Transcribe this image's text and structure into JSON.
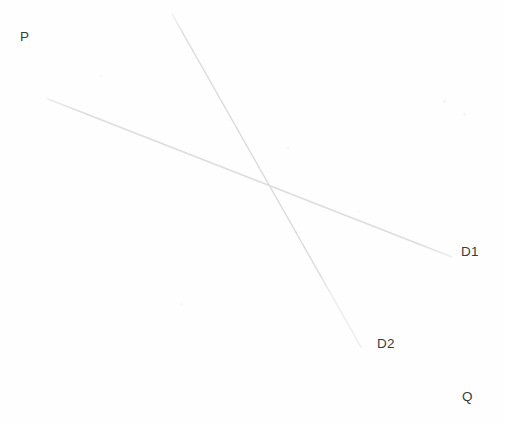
{
  "figure": {
    "kind": "economics-demand-curve-diagram",
    "background_color": "#fefefe",
    "width": 505,
    "height": 423
  },
  "axes": {
    "y_axis": {
      "label": "P",
      "meaning": "Price",
      "color": "#e2e2e2",
      "x": 38,
      "y_top": 25,
      "y_bottom": 371
    },
    "x_axis": {
      "label": "Q",
      "meaning": "Quantity",
      "color": "#e2e2e2",
      "y": 371,
      "x_left": 38,
      "x_right": 490
    }
  },
  "curves": [
    {
      "label": "D1",
      "style": "flat-downward-sloping",
      "color": "#dedede",
      "x1": 48,
      "y1": 99,
      "x2": 452,
      "y2": 257,
      "label_x": 461,
      "label_y": 245
    },
    {
      "label": "D2",
      "style": "steep-downward-sloping",
      "color": "#dedede",
      "x1": 172,
      "y1": 14,
      "x2": 361,
      "y2": 347,
      "label_x": 377,
      "label_y": 337
    }
  ],
  "intersection": {
    "x": 266,
    "y": 183
  },
  "chart_data": {
    "type": "line",
    "title": "",
    "xlabel": "Q",
    "ylabel": "P",
    "grid": false,
    "legend": "inline-end-of-curve-labels",
    "xlim": [
      38,
      490
    ],
    "ylim": [
      371,
      25
    ],
    "series": [
      {
        "name": "D1",
        "description": "Flatter demand curve (more elastic)",
        "points": [
          [
            48,
            99
          ],
          [
            452,
            257
          ]
        ]
      },
      {
        "name": "D2",
        "description": "Steeper demand curve (less elastic)",
        "points": [
          [
            172,
            14
          ],
          [
            361,
            347
          ]
        ]
      }
    ],
    "annotations": [
      {
        "text": "P",
        "x": 20,
        "y": 30,
        "role": "y-axis-label"
      },
      {
        "text": "Q",
        "x": 462,
        "y": 390,
        "role": "x-axis-label"
      },
      {
        "text": "D1",
        "x": 461,
        "y": 245,
        "role": "series-label"
      },
      {
        "text": "D2",
        "x": 377,
        "y": 337,
        "role": "series-label"
      }
    ]
  }
}
